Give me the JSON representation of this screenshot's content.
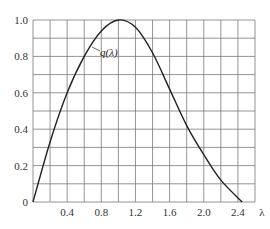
{
  "chart_data": {
    "type": "line",
    "title": "",
    "xlabel": "λ",
    "ylabel": "",
    "xlim": [
      0,
      2.6
    ],
    "ylim": [
      0,
      1.0
    ],
    "grid": true,
    "x_ticks": [
      "0.4",
      "0.8",
      "1.2",
      "1.6",
      "2.0",
      "2.4"
    ],
    "x_tick_values": [
      0.4,
      0.8,
      1.2,
      1.6,
      2.0,
      2.4
    ],
    "y_ticks": [
      "0",
      "0.2",
      "0.4",
      "0.6",
      "0.8",
      "1.0"
    ],
    "y_tick_values": [
      0,
      0.2,
      0.4,
      0.6,
      0.8,
      1.0
    ],
    "annotations": [
      {
        "text": "q(λ)",
        "x": 1.05,
        "y": 0.87
      }
    ],
    "series": [
      {
        "name": "q(λ)",
        "x": [
          0,
          0.2,
          0.4,
          0.6,
          0.8,
          1.0,
          1.2,
          1.4,
          1.6,
          1.8,
          2.0,
          2.2,
          2.45
        ],
        "values": [
          0,
          0.33,
          0.6,
          0.8,
          0.94,
          1.0,
          0.96,
          0.82,
          0.62,
          0.42,
          0.26,
          0.12,
          0
        ]
      }
    ]
  },
  "axis": {
    "x_label": "λ",
    "y_tick_labels": [
      "0",
      "0.2",
      "0.4",
      "0.6",
      "0.8",
      "1.0"
    ],
    "x_tick_labels": [
      "0.4",
      "0.8",
      "1.2",
      "1.6",
      "2.0",
      "2.4"
    ]
  },
  "curve_label": "q(λ)"
}
